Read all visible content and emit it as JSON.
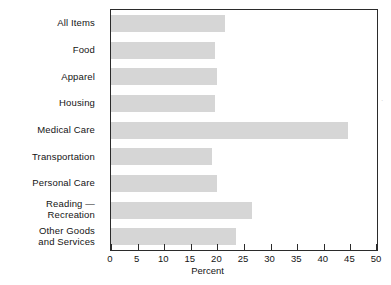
{
  "chart_data": {
    "type": "bar",
    "orientation": "horizontal",
    "title": "",
    "subtitle": "",
    "xlabel": "Percent",
    "ylabel": "",
    "xlim": [
      0,
      50
    ],
    "ylim": null,
    "grid": false,
    "legend": null,
    "legend_position": "none",
    "xticks": [
      0,
      5,
      10,
      15,
      20,
      25,
      30,
      35,
      40,
      45,
      50
    ],
    "xtick_labels": [
      "0",
      "5",
      "10",
      "15",
      "20",
      "25",
      "30",
      "35",
      "40",
      "45",
      "50"
    ],
    "categories": [
      "All Items",
      "Food",
      "Apparel",
      "Housing",
      "Medical Care",
      "Transportation",
      "Personal Care",
      "Reading — Recreation",
      "Other Goods\nand Services"
    ],
    "values": [
      21.5,
      19.5,
      20,
      19.5,
      44.5,
      19,
      20,
      26.5,
      23.5
    ],
    "bar_color": "#d6d6d6",
    "frame_color": "#2b2b2b",
    "background": "#ffffff"
  },
  "axis": {
    "x_title": "Percent"
  },
  "marks": {
    "stray_speck": "·"
  }
}
